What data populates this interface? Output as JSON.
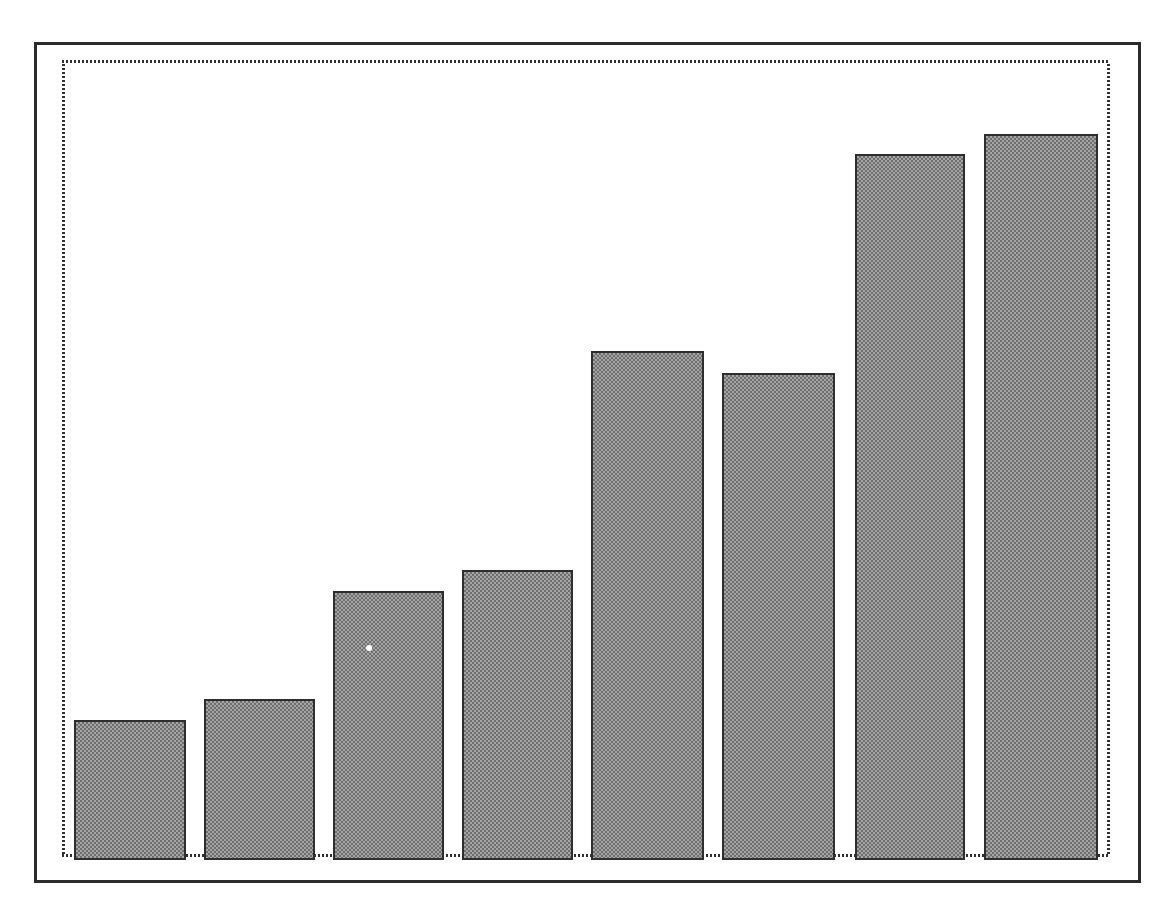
{
  "figure": {
    "title": "",
    "background_color": "#ffffff",
    "outer_frame": {
      "name": "outer-frame",
      "color": "#2b2b2b",
      "x": 34,
      "y": 42,
      "width": 1107,
      "height": 841,
      "line_width": 3
    },
    "plot_frame": {
      "name": "plot-frame",
      "color": "#303030",
      "style": "dotted",
      "x": 59,
      "y": 57,
      "width": 1054,
      "height": 803,
      "line_width": 3
    }
  },
  "chart_data": {
    "type": "bar",
    "title": "",
    "subtitle": "",
    "xlabel": "",
    "ylabel": "",
    "categories": [
      "1",
      "2",
      "3",
      "4",
      "5",
      "6",
      "7",
      "8"
    ],
    "values": [
      140,
      161,
      269,
      290,
      509,
      487,
      706,
      726
    ],
    "ylim": [
      0,
      803
    ],
    "xlim": [
      0,
      1054
    ],
    "grid": false,
    "legend": null,
    "annotations": [],
    "tick_labels_x": [],
    "tick_labels_y": [],
    "bar_fill_color": "#8c8c8c",
    "bar_edge_color": "#2e2e2e",
    "bar_fill_pattern": "halftone-dither",
    "bars": [
      {
        "label": "bar-1",
        "value": 140,
        "x": 74,
        "y": 720,
        "width": 112,
        "height": 140
      },
      {
        "label": "bar-2",
        "value": 161,
        "x": 204,
        "y": 699,
        "width": 111,
        "height": 161
      },
      {
        "label": "bar-3",
        "value": 269,
        "x": 333,
        "y": 591,
        "width": 111,
        "height": 269
      },
      {
        "label": "bar-4",
        "value": 290,
        "x": 462,
        "y": 570,
        "width": 111,
        "height": 290
      },
      {
        "label": "bar-5",
        "value": 509,
        "x": 591,
        "y": 351,
        "width": 113,
        "height": 509
      },
      {
        "label": "bar-6",
        "value": 487,
        "x": 722,
        "y": 373,
        "width": 113,
        "height": 487
      },
      {
        "label": "bar-7",
        "value": 706,
        "x": 855,
        "y": 154,
        "width": 110,
        "height": 706
      },
      {
        "label": "bar-8",
        "value": 726,
        "x": 984,
        "y": 134,
        "width": 114,
        "height": 726
      }
    ],
    "baseline_y": 860,
    "artifacts": [
      {
        "name": "white-speck",
        "x": 366,
        "y": 645,
        "size": 6
      }
    ]
  }
}
